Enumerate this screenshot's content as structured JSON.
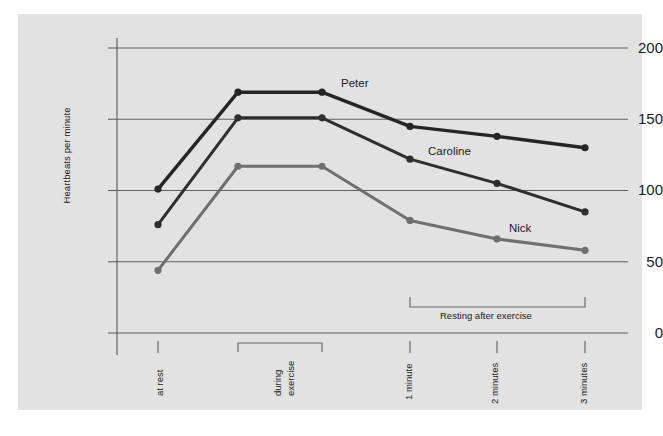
{
  "chart_data": {
    "type": "line",
    "title": "",
    "xlabel": "",
    "ylabel": "Heartbeats per minute",
    "ylim": [
      0,
      200
    ],
    "yticks": [
      0,
      50,
      100,
      150,
      200
    ],
    "ytick_labels": [
      "0",
      "50",
      "100",
      "150",
      "200"
    ],
    "grid": true,
    "grid_axis": "y",
    "legend": "inline-labels",
    "categories": [
      "at rest",
      "during exercise start",
      "during exercise end",
      "1 minute",
      "2 minutes",
      "3 minutes"
    ],
    "xtick_labels": [
      "at rest",
      "during\nexercise",
      "1 minute",
      "2 minutes",
      "3 minutes"
    ],
    "xticks_visible": [
      "at rest",
      "1 minute",
      "2 minutes",
      "3 minutes"
    ],
    "series": [
      {
        "name": "Peter",
        "color": "#252525",
        "values": [
          101,
          169,
          169,
          145,
          138,
          130
        ]
      },
      {
        "name": "Caroline",
        "color": "#2e2e2e",
        "values": [
          76,
          151,
          151,
          122,
          105,
          85
        ]
      },
      {
        "name": "Nick",
        "color": "#6f6f6f",
        "values": [
          44,
          117,
          117,
          79,
          66,
          58
        ]
      }
    ],
    "annotations": [
      {
        "text": "during exercise",
        "type": "bracket",
        "orientation": "vertical-label",
        "lines": [
          "during",
          "exercise"
        ]
      },
      {
        "text": "Resting after exercise",
        "type": "bracket",
        "orientation": "horizontal-label"
      }
    ],
    "colors": {
      "panel_background": "#e2e2e2",
      "page_background": "#ffffff",
      "axis": "#6b6b6b",
      "gridline": "#5f5f5f",
      "text": "#1b1b1b"
    }
  },
  "xaxis": {
    "tick_at_rest": "at rest",
    "tick_during_1": "during",
    "tick_during_2": "exercise",
    "tick_1min": "1 minute",
    "tick_2min": "2 minutes",
    "tick_3min": "3 minutes"
  },
  "brackets": {
    "resting_after_exercise": "Resting after exercise"
  },
  "yaxis": {
    "label": "Heartbeats per minute",
    "t0": "0",
    "t50": "50",
    "t100": "100",
    "t150": "150",
    "t200": "200"
  },
  "series_labels": {
    "peter": "Peter",
    "caroline": "Caroline",
    "nick": "Nick"
  }
}
